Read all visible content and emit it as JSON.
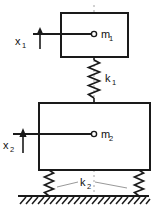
{
  "figure": {
    "line_color": "#1a1a1a",
    "centerline_color": "#9a9a9a",
    "background": "#ffffff"
  },
  "masses": [
    {
      "id": "mass-1",
      "label": "m",
      "subscript": "1",
      "box": {
        "x": 61,
        "y": 13,
        "width": 67,
        "height": 44
      },
      "node": {
        "cx": 94,
        "cy": 34,
        "r": 2.6
      }
    },
    {
      "id": "mass-2",
      "label": "m",
      "subscript": "2",
      "box": {
        "x": 39,
        "y": 103,
        "width": 111,
        "height": 67
      },
      "node": {
        "cx": 94,
        "cy": 134,
        "r": 2.6
      }
    }
  ],
  "springs": [
    {
      "id": "spring-k1",
      "label": "k",
      "subscript": "1",
      "label_pos": {
        "x": 105,
        "y": 78
      },
      "cx": 94,
      "y_top": 57,
      "y_bottom": 103,
      "amplitude": 5.5,
      "coils": 8
    },
    {
      "id": "spring-k2-left",
      "label": "",
      "subscript": "",
      "cx": 49,
      "y_top": 170,
      "y_bottom": 196,
      "amplitude": 4.5,
      "coils": 6
    },
    {
      "id": "spring-k2-right",
      "label": "",
      "subscript": "",
      "cx": 139,
      "y_top": 170,
      "y_bottom": 196,
      "amplitude": 4.5,
      "coils": 6
    }
  ],
  "spring_group_label": {
    "id": "label-k2",
    "label": "k",
    "subscript": "2",
    "pos": {
      "x": 84,
      "y": 188
    },
    "leader_left": {
      "x1": 58,
      "y1": 186,
      "x2": 78,
      "y2": 182
    },
    "leader_right": {
      "x1": 96,
      "y1": 182,
      "x2": 128,
      "y2": 187
    }
  },
  "displacements": [
    {
      "id": "displacement-x1",
      "label": "x",
      "subscript": "1",
      "label_pos": {
        "x": 15,
        "y": 42
      },
      "ref_line": {
        "x1": 33,
        "y1": 34,
        "x2": 94,
        "y2": 34
      },
      "arrow": {
        "x": 40,
        "y_tail": 48,
        "y_head": 30
      }
    },
    {
      "id": "displacement-x2",
      "label": "x",
      "subscript": "2",
      "label_pos": {
        "x": 5,
        "y": 146
      },
      "ref_line": {
        "x1": 13,
        "y1": 134,
        "x2": 94,
        "y2": 134
      },
      "arrow": {
        "x": 23,
        "y_tail": 152,
        "y_head": 129
      }
    }
  ],
  "ground": {
    "id": "ground-hatch",
    "line": {
      "x1": 18,
      "y1": 196,
      "x2": 149,
      "y2": 196
    },
    "hatch_count": 23,
    "hatch_depth": 8,
    "hatch_slant": 6
  },
  "centerline": {
    "id": "centerline",
    "x": 94,
    "y_top": 5,
    "y_bottom": 200,
    "dash": "2,3"
  }
}
